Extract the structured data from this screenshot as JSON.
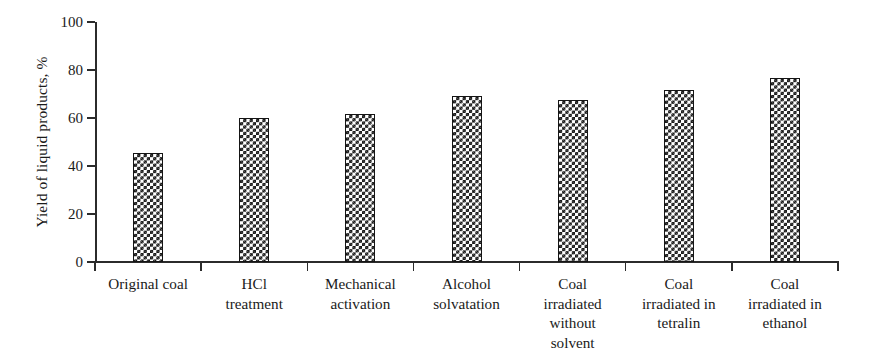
{
  "chart_data": {
    "type": "bar",
    "title": "",
    "subtitle": "",
    "xlabel": "",
    "ylabel": "Yield of liquid products, %",
    "ylim": [
      0,
      100
    ],
    "xlim": [
      0,
      7
    ],
    "grid": false,
    "legend": null,
    "y_ticks": [
      0,
      20,
      40,
      60,
      80,
      100
    ],
    "y_tick_labels": [
      "0",
      "20",
      "40",
      "60",
      "80",
      "100"
    ],
    "categories": [
      "Original coal",
      "HCl treatment",
      "Mechanical activation",
      "Alcohol solvatation",
      "Coal irradiated without solvent",
      "Coal irradiated in tetralin",
      "Coal irradiated in ethanol"
    ],
    "category_label_lines": [
      [
        "Original coal"
      ],
      [
        "HCl",
        "treatment"
      ],
      [
        "Mechanical",
        "activation"
      ],
      [
        "Alcohol",
        "solvatation"
      ],
      [
        "Coal",
        "irradiated",
        "without",
        "solvent"
      ],
      [
        "Coal",
        "irradiated in",
        "tetralin"
      ],
      [
        "Coal",
        "irradiated in",
        "ethanol"
      ]
    ],
    "values": [
      45.5,
      60.0,
      61.5,
      69.0,
      67.5,
      71.5,
      76.5
    ],
    "bar_fill": "checkerboard",
    "bar_color": "#171717",
    "bar_edge_color": "#151515",
    "axis_color": "#2b2b2b",
    "background": "#ffffff"
  }
}
